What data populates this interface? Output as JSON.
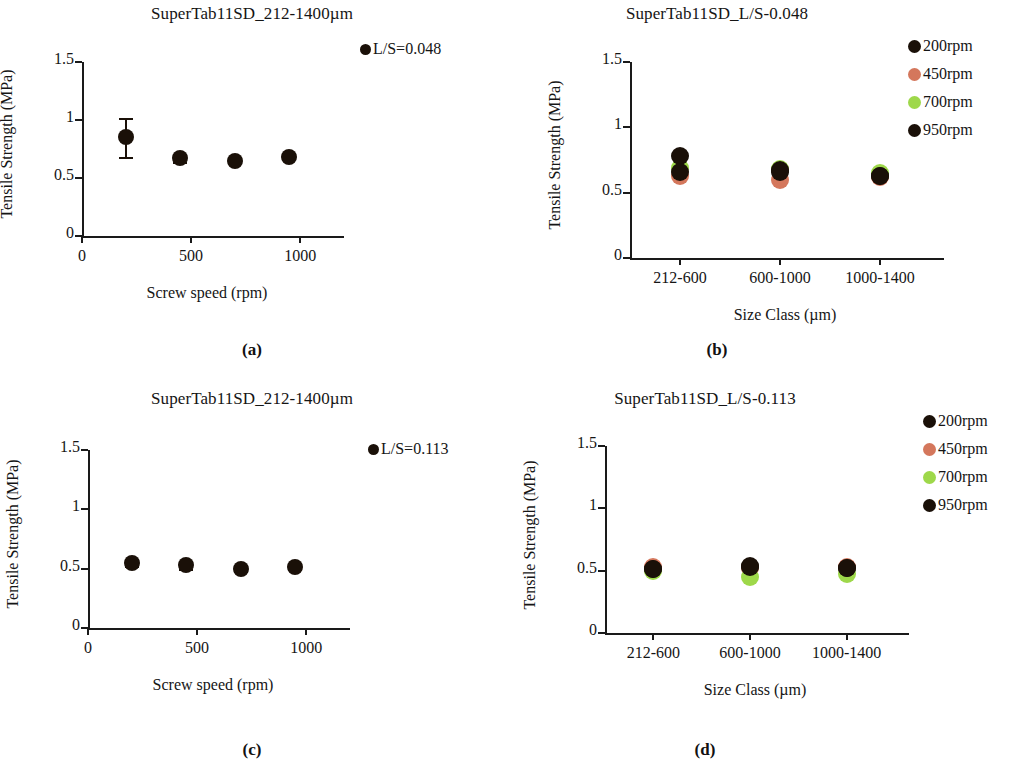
{
  "figure": {
    "background": "#ffffff",
    "colors": {
      "black": "#1a1008",
      "salmon": "#d4775c",
      "green": "#9ed84a",
      "axis": "#1a1a1a"
    }
  },
  "panels": [
    {
      "key": "a",
      "letter": "(a)",
      "title": "SuperTab11SD_212-1400µm",
      "legend_label": "L/S=0.048"
    },
    {
      "key": "b",
      "letter": "(b)",
      "title": "SuperTab11SD_L/S-0.048",
      "legend_label": ""
    },
    {
      "key": "c",
      "letter": "(c)",
      "title": "SuperTab11SD_212-1400µm",
      "legend_label": "L/S=0.113"
    },
    {
      "key": "d",
      "letter": "(d)",
      "title": "SuperTab11SD_L/S-0.113",
      "legend_label": ""
    }
  ],
  "legend_series": [
    {
      "label": "200rpm",
      "color": "#1a1008"
    },
    {
      "label": "450rpm",
      "color": "#d4775c"
    },
    {
      "label": "700rpm",
      "color": "#9ed84a"
    },
    {
      "label": "950rpm",
      "color": "#1a1008"
    }
  ],
  "chart_data": [
    {
      "panel": "a",
      "type": "scatter",
      "title": "SuperTab11SD_212-1400µm",
      "xlabel": "Screw speed (rpm)",
      "ylabel": "Tensile  Strength (MPa)",
      "xlim": [
        0,
        1100
      ],
      "ylim": [
        0,
        1.5
      ],
      "xticks": [
        0,
        500,
        1000
      ],
      "xticklabels": [
        "0",
        "500",
        "1000"
      ],
      "yticks": [
        0,
        0.5,
        1,
        1.5
      ],
      "yticklabels": [
        "0",
        "0.5",
        "1",
        "1.5"
      ],
      "grid": false,
      "legend": [
        "L/S=0.048"
      ],
      "legend_position": "top-right",
      "series": [
        {
          "name": "L/S=0.048",
          "color": "#1a1008",
          "x": [
            200,
            450,
            700,
            950
          ],
          "values": [
            0.85,
            0.67,
            0.65,
            0.68
          ],
          "errors": [
            0.17,
            0.03,
            0.01,
            0.01
          ]
        }
      ]
    },
    {
      "panel": "b",
      "type": "scatter",
      "title": "SuperTab11SD_L/S-0.048",
      "xlabel": "Size Class (µm)",
      "ylabel": "Tensile Strength (MPa)",
      "categories": [
        "212-600",
        "600-1000",
        "1000-1400"
      ],
      "ylim": [
        0,
        1.5
      ],
      "yticks": [
        0,
        0.5,
        1,
        1.5
      ],
      "yticklabels": [
        "0",
        "0.5",
        "1",
        "1.5"
      ],
      "grid": false,
      "legend": [
        "200rpm",
        "450rpm",
        "700rpm",
        "950rpm"
      ],
      "legend_position": "right",
      "series": [
        {
          "name": "200rpm",
          "color": "#1a1008",
          "values": [
            0.78,
            0.67,
            0.63
          ],
          "errors": [
            0.02,
            0.02,
            0.02
          ]
        },
        {
          "name": "450rpm",
          "color": "#d4775c",
          "values": [
            0.63,
            0.6,
            0.62
          ],
          "errors": [
            0.02,
            0.02,
            0.02
          ]
        },
        {
          "name": "700rpm",
          "color": "#9ed84a",
          "values": [
            0.69,
            0.68,
            0.65
          ],
          "errors": [
            0.02,
            0.02,
            0.02
          ]
        },
        {
          "name": "950rpm",
          "color": "#1a1008",
          "values": [
            0.66,
            0.66,
            0.63
          ],
          "errors": [
            0.02,
            0.02,
            0.02
          ]
        }
      ]
    },
    {
      "panel": "c",
      "type": "scatter",
      "title": "SuperTab11SD_212-1400µm",
      "xlabel": "Screw speed (rpm)",
      "ylabel": "Tensile Strength (MPa)",
      "xlim": [
        0,
        1100
      ],
      "ylim": [
        0,
        1.5
      ],
      "xticks": [
        0,
        500,
        1000
      ],
      "xticklabels": [
        "0",
        "500",
        "1000"
      ],
      "yticks": [
        0,
        0.5,
        1,
        1.5
      ],
      "yticklabels": [
        "0",
        "0.5",
        "1",
        "1.5"
      ],
      "grid": false,
      "legend": [
        "L/S=0.113"
      ],
      "legend_position": "top-right",
      "series": [
        {
          "name": "L/S=0.113",
          "color": "#1a1008",
          "x": [
            200,
            450,
            700,
            950
          ],
          "values": [
            0.55,
            0.53,
            0.5,
            0.51
          ],
          "errors": [
            0.03,
            0.03,
            0.02,
            0.01
          ]
        }
      ]
    },
    {
      "panel": "d",
      "type": "scatter",
      "title": "SuperTab11SD_L/S-0.113",
      "xlabel": "Size Class (µm)",
      "ylabel": "Tensile Strength (MPa)",
      "categories": [
        "212-600",
        "600-1000",
        "1000-1400"
      ],
      "ylim": [
        0,
        1.5
      ],
      "yticks": [
        0,
        0.5,
        1,
        1.5
      ],
      "yticklabels": [
        "0",
        "0.5",
        "1",
        "1.5"
      ],
      "grid": false,
      "legend": [
        "200rpm",
        "450rpm",
        "700rpm",
        "950rpm"
      ],
      "legend_position": "right",
      "series": [
        {
          "name": "200rpm",
          "color": "#1a1008",
          "values": [
            0.51,
            0.54,
            0.52
          ],
          "errors": [
            0.02,
            0.02,
            0.02
          ]
        },
        {
          "name": "450rpm",
          "color": "#d4775c",
          "values": [
            0.53,
            0.52,
            0.53
          ],
          "errors": [
            0.02,
            0.02,
            0.02
          ]
        },
        {
          "name": "700rpm",
          "color": "#9ed84a",
          "values": [
            0.5,
            0.45,
            0.47
          ],
          "errors": [
            0.02,
            0.02,
            0.02
          ]
        },
        {
          "name": "950rpm",
          "color": "#1a1008",
          "values": [
            0.51,
            0.53,
            0.52
          ],
          "errors": [
            0.02,
            0.02,
            0.02
          ]
        }
      ]
    }
  ]
}
